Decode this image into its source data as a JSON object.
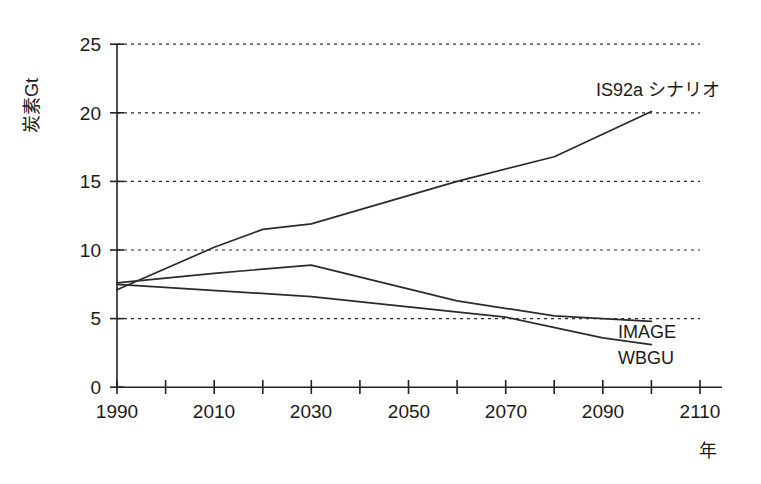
{
  "chart_data": {
    "type": "line",
    "title": "",
    "xlabel": "年",
    "ylabel": "炭素Gt",
    "xlim": [
      1990,
      2110
    ],
    "ylim": [
      0,
      25
    ],
    "grid": true,
    "grid_axis": "y",
    "legend_position": "inline-right",
    "x_ticks": [
      1990,
      2000,
      2010,
      2020,
      2030,
      2040,
      2050,
      2060,
      2070,
      2080,
      2090,
      2100,
      2110
    ],
    "x_tick_labels": [
      "1990",
      "",
      "2010",
      "",
      "2030",
      "",
      "2050",
      "",
      "2070",
      "",
      "2090",
      "",
      "2110"
    ],
    "y_ticks": [
      0,
      5,
      10,
      15,
      20,
      25
    ],
    "y_tick_labels": [
      "0",
      "5",
      "10",
      "15",
      "20",
      "25"
    ],
    "series": [
      {
        "name": "IS92a シナリオ",
        "label": "IS92a シナリオ",
        "x": [
          1990,
          2010,
          2020,
          2030,
          2060,
          2080,
          2100
        ],
        "values": [
          7.1,
          10.2,
          11.5,
          11.9,
          15.0,
          16.8,
          20.1
        ]
      },
      {
        "name": "IMAGE",
        "label": "IMAGE",
        "x": [
          1990,
          2010,
          2030,
          2060,
          2080,
          2100
        ],
        "values": [
          7.6,
          8.3,
          8.9,
          6.3,
          5.2,
          4.8
        ]
      },
      {
        "name": "WBGU",
        "label": "WBGU",
        "x": [
          1990,
          2030,
          2070,
          2090,
          2100
        ],
        "values": [
          7.5,
          6.6,
          5.1,
          3.6,
          3.1
        ]
      }
    ]
  },
  "axes": {
    "y_axis_title": "炭素Gt",
    "x_axis_unit": "年"
  },
  "annotations": {
    "is92a_label": "IS92a シナリオ",
    "image_label": "IMAGE",
    "wbgu_label": "WBGU"
  },
  "colors": {
    "line": "#2b2b2b",
    "axis": "#222222",
    "grid": "#2b2b2b",
    "background": "#ffffff",
    "text": "#1a1a1a"
  }
}
